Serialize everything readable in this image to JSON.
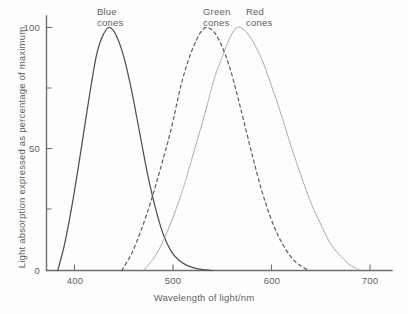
{
  "chart_data": {
    "type": "line",
    "title": "",
    "xlabel": "Wavelength of light/nm",
    "ylabel": "Light absorption expressed as percentage of maximum",
    "xlim": [
      370,
      720
    ],
    "ylim": [
      0,
      105
    ],
    "grid": false,
    "legend_position": "inline-annotations",
    "xticks": [
      400,
      500,
      600,
      700
    ],
    "xtick_labels": [
      "400",
      "500",
      "600",
      "700"
    ],
    "yticks": [
      0,
      25,
      50,
      75,
      100
    ],
    "ytick_labels": [
      "0",
      "",
      "50",
      "",
      "100"
    ],
    "ytick_labels_shown": [
      "0",
      "50",
      "100"
    ],
    "series": [
      {
        "name": "Blue cones",
        "label_line1": "Blue",
        "label_line2": "cones",
        "linestyle": "solid",
        "color": "#4f4f52",
        "peak_x": 435,
        "peak_y": 100,
        "x": [
          383,
          390,
          398,
          406,
          414,
          422,
          428,
          435,
          442,
          450,
          458,
          466,
          474,
          482,
          490,
          498,
          506,
          514,
          522,
          530,
          540
        ],
        "y": [
          0,
          11,
          28,
          48,
          69,
          88,
          96,
          100,
          97,
          88,
          74,
          57,
          40,
          26,
          15,
          8,
          4.2,
          2.1,
          1.0,
          0.4,
          0
        ]
      },
      {
        "name": "Green cones",
        "label_line1": "Green",
        "label_line2": "cones",
        "linestyle": "dashed",
        "color": "#5c5c60",
        "peak_x": 535,
        "peak_y": 100,
        "x": [
          448,
          458,
          468,
          478,
          488,
          498,
          508,
          516,
          524,
          530,
          535,
          542,
          550,
          558,
          566,
          574,
          582,
          590,
          598,
          606,
          614,
          622,
          630,
          638
        ],
        "y": [
          0,
          7,
          17,
          29,
          43,
          58,
          76,
          87,
          95,
          99,
          100,
          98,
          92,
          83,
          71,
          58,
          45,
          33,
          23,
          15,
          9,
          4.5,
          1.8,
          0
        ]
      },
      {
        "name": "Red cones",
        "label_line1": "Red",
        "label_line2": "cones",
        "linestyle": "dotted",
        "color": "#9a9a9e",
        "peak_x": 565,
        "peak_y": 100,
        "x": [
          470,
          482,
          492,
          502,
          512,
          522,
          532,
          542,
          550,
          558,
          565,
          572,
          580,
          590,
          600,
          610,
          620,
          630,
          640,
          650,
          660,
          670,
          680,
          690
        ],
        "y": [
          0,
          6,
          14,
          24,
          36,
          50,
          64,
          79,
          88,
          96,
          100,
          99,
          95,
          87,
          76,
          64,
          51,
          39,
          28,
          19,
          11,
          6,
          2.2,
          0
        ]
      }
    ]
  }
}
